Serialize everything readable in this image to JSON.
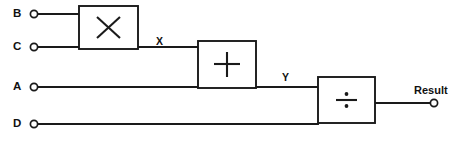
{
  "diagram": {
    "stroke_color": "#1a1a1a",
    "background_color": "#ffffff",
    "inputs": [
      {
        "id": "B",
        "label": "B",
        "terminal": "open-circle",
        "x": 31,
        "y": 14
      },
      {
        "id": "C",
        "label": "C",
        "terminal": "open-circle",
        "x": 31,
        "y": 47
      },
      {
        "id": "A",
        "label": "A",
        "terminal": "open-circle",
        "x": 31,
        "y": 87
      },
      {
        "id": "D",
        "label": "D",
        "terminal": "open-circle",
        "x": 31,
        "y": 124
      }
    ],
    "blocks": [
      {
        "id": "multiplier",
        "operation": "multiply",
        "symbol": "×",
        "icon": "multiply-icon",
        "x": 79,
        "y": 6,
        "width": 59,
        "height": 43,
        "inputs": [
          "B",
          "C"
        ],
        "output": "X"
      },
      {
        "id": "adder",
        "operation": "add",
        "symbol": "+",
        "icon": "plus-icon",
        "x": 198,
        "y": 41,
        "width": 58,
        "height": 47,
        "inputs": [
          "X",
          "A"
        ],
        "output": "Y"
      },
      {
        "id": "divider",
        "operation": "divide",
        "symbol": "÷",
        "icon": "divide-icon",
        "x": 318,
        "y": 77,
        "width": 57,
        "height": 46,
        "inputs": [
          "Y",
          "D"
        ],
        "output": "Result"
      }
    ],
    "signals": [
      {
        "id": "X",
        "label": "X",
        "from": "multiplier",
        "to": "adder",
        "x": 159,
        "y": 42
      },
      {
        "id": "Y",
        "label": "Y",
        "from": "adder",
        "to": "divider",
        "x": 285,
        "y": 78
      }
    ],
    "output": {
      "id": "Result",
      "label": "Result",
      "terminal": "open-circle",
      "x": 437,
      "y": 103,
      "label_x": 437,
      "label_y": 91
    }
  }
}
